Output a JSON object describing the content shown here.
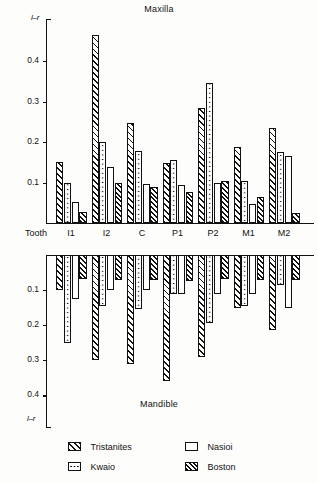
{
  "figure": {
    "maxilla_title": "Maxilla",
    "mandible_title": "Mandible",
    "y_axis_label": "l–r",
    "tooth_word": "Tooth"
  },
  "legend": {
    "items": [
      {
        "label": "Tristanites",
        "pattern": "diagonal-hatch"
      },
      {
        "label": "Nasioi",
        "pattern": "empty"
      },
      {
        "label": "Kwaio",
        "pattern": "dotted"
      },
      {
        "label": "Boston",
        "pattern": "dense-diagonal-hatch"
      }
    ]
  },
  "chart_data": [
    {
      "type": "bar",
      "title": "Maxilla",
      "xlabel": "Tooth",
      "ylabel": "l–r",
      "ylim": [
        0,
        0.47
      ],
      "yticks": [
        0.1,
        0.2,
        0.3,
        0.4
      ],
      "ytick_labels": [
        "0.1",
        "0.2",
        "0.3",
        "0.4"
      ],
      "grid": false,
      "direction": "up",
      "categories": [
        "I1",
        "I2",
        "C",
        "P1",
        "P2",
        "M1",
        "M2"
      ],
      "series": [
        {
          "name": "Tristanites",
          "values": [
            0.15,
            0.465,
            0.248,
            0.149,
            0.285,
            0.187,
            0.235
          ]
        },
        {
          "name": "Kwaio",
          "values": [
            0.1,
            0.2,
            0.177,
            0.156,
            0.345,
            0.104,
            0.176
          ]
        },
        {
          "name": "Nasioi",
          "values": [
            0.051,
            0.138,
            0.097,
            0.094,
            0.098,
            0.048,
            0.166
          ]
        },
        {
          "name": "Boston",
          "values": [
            0.026,
            0.099,
            0.088,
            0.076,
            0.104,
            0.065,
            0.025
          ]
        }
      ]
    },
    {
      "type": "bar",
      "title": "Mandible",
      "xlabel": "Tooth",
      "ylabel": "l–r",
      "ylim": [
        0,
        0.44
      ],
      "yticks": [
        0.1,
        0.2,
        0.3,
        0.4
      ],
      "ytick_labels": [
        "0.1",
        "0.2",
        "0.3",
        "0.4"
      ],
      "grid": false,
      "direction": "down",
      "categories": [
        "I1",
        "I2",
        "C",
        "P1",
        "P2",
        "M1",
        "M2"
      ],
      "series": [
        {
          "name": "Tristanites",
          "values": [
            0.1,
            0.3,
            0.31,
            0.36,
            0.29,
            0.15,
            0.215
          ]
        },
        {
          "name": "Kwaio",
          "values": [
            0.25,
            0.145,
            0.155,
            0.11,
            0.195,
            0.145,
            0.085
          ]
        },
        {
          "name": "Nasioi",
          "values": [
            0.125,
            0.1,
            0.1,
            0.11,
            0.11,
            0.11,
            0.15
          ]
        },
        {
          "name": "Boston",
          "values": [
            0.068,
            0.072,
            0.072,
            0.075,
            0.068,
            0.07,
            0.07
          ]
        }
      ]
    }
  ]
}
